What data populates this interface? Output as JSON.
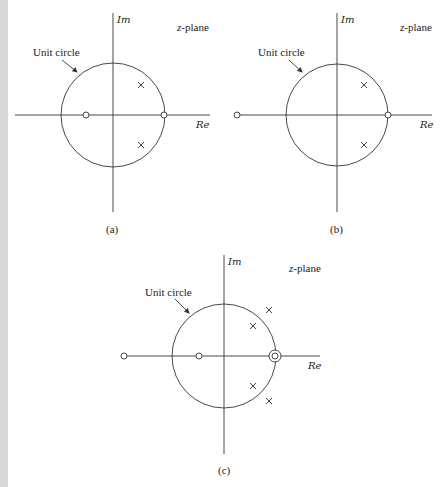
{
  "panels": [
    {
      "id": "a",
      "caption": "(a)",
      "plane_label": "z-plane",
      "plane_var": "z",
      "plane_suffix": "-plane",
      "im_label": "Im",
      "re_label": "Re",
      "unit_circle_label": "Unit circle",
      "zeros": [
        {
          "re": -0.5,
          "im": 0
        },
        {
          "re": 1.0,
          "im": 0
        }
      ],
      "poles": [
        {
          "re": 0.55,
          "im": 0.6
        },
        {
          "re": 0.55,
          "im": -0.6
        }
      ]
    },
    {
      "id": "b",
      "caption": "(b)",
      "plane_label": "z-plane",
      "plane_var": "z",
      "plane_suffix": "-plane",
      "im_label": "Im",
      "re_label": "Re",
      "unit_circle_label": "Unit circle",
      "zeros": [
        {
          "re": -1.95,
          "im": 0
        },
        {
          "re": 1.0,
          "im": 0
        }
      ],
      "poles": [
        {
          "re": 0.55,
          "im": 0.6
        },
        {
          "re": 0.55,
          "im": -0.6
        }
      ]
    },
    {
      "id": "c",
      "caption": "(c)",
      "plane_label": "z-plane",
      "plane_var": "z",
      "plane_suffix": "-plane",
      "im_label": "Im",
      "re_label": "Re",
      "unit_circle_label": "Unit circle",
      "zeros": [
        {
          "re": -1.9,
          "im": 0
        },
        {
          "re": -0.5,
          "im": 0
        },
        {
          "re": 1.0,
          "im": 0,
          "order": 2
        }
      ],
      "poles": [
        {
          "re": 0.55,
          "im": 0.55
        },
        {
          "re": 0.85,
          "im": 0.85
        },
        {
          "re": 0.55,
          "im": -0.55
        },
        {
          "re": 0.85,
          "im": -0.85
        }
      ]
    }
  ]
}
